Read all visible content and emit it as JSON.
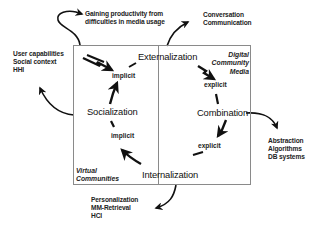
{
  "diagram": {
    "modes": {
      "externalization": "Externalization",
      "combination": "Combination",
      "internalization": "Internalization",
      "socialization": "Socialization"
    },
    "knowledge_types": {
      "top_left": "implicit",
      "bottom_left": "implicit",
      "top_right": "explicit",
      "bottom_right": "explicit"
    },
    "regions": {
      "left": [
        "Virtual",
        "Communities"
      ],
      "right": [
        "Digital",
        "Community",
        "Media"
      ]
    },
    "notes": {
      "top": [
        "Gaining productivity from",
        "difficulties in media usage"
      ],
      "top_right": [
        "Conversation",
        "Communication"
      ],
      "left": [
        "User capabilities",
        "Social context",
        "HHI"
      ],
      "right": [
        "Abstraction",
        "Algorithms",
        "DB systems"
      ],
      "bottom": [
        "Personalization",
        "MM-Retrieval",
        "HCI"
      ]
    },
    "colors": {
      "ink": "#111111",
      "frame": "#8a8a8a",
      "background": "#ffffff"
    }
  }
}
